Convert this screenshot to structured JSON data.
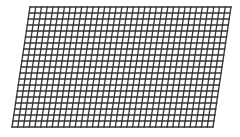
{
  "figure": {
    "type": "skewed-grid",
    "corners": {
      "top_left": [
        30,
        7
      ],
      "top_right": [
        231,
        7
      ],
      "bottom_right": [
        213,
        127
      ],
      "bottom_left": [
        12,
        127
      ]
    },
    "columns": 35,
    "rows": 20,
    "line_color": "#333333",
    "line_width": 1.3,
    "background": "#ffffff"
  }
}
